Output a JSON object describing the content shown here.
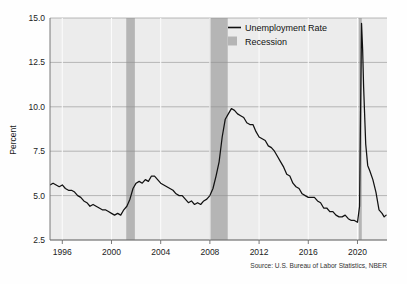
{
  "chart_data": {
    "type": "line",
    "title": "",
    "xlabel": "",
    "ylabel": "Percent",
    "xlim": [
      1995.0,
      2022.4
    ],
    "ylim": [
      2.5,
      15.0
    ],
    "grid": true,
    "legend_position": "top-right",
    "xticks": [
      "1996",
      "2000",
      "2004",
      "2008",
      "2012",
      "2016",
      "2020"
    ],
    "xtick_values": [
      1996,
      2000,
      2004,
      2008,
      2012,
      2016,
      2020
    ],
    "yticks": [
      "2.5",
      "5.0",
      "7.5",
      "10.0",
      "12.5",
      "15.0"
    ],
    "ytick_values": [
      2.5,
      5.0,
      7.5,
      10.0,
      12.5,
      15.0
    ],
    "series": [
      {
        "name": "Unemployment Rate",
        "color": "#111111",
        "x": [
          1995.0,
          1995.25,
          1995.5,
          1995.75,
          1996.0,
          1996.25,
          1996.5,
          1996.75,
          1997.0,
          1997.25,
          1997.5,
          1997.75,
          1998.0,
          1998.25,
          1998.5,
          1998.75,
          1999.0,
          1999.25,
          1999.5,
          1999.75,
          2000.0,
          2000.25,
          2000.5,
          2000.75,
          2001.0,
          2001.25,
          2001.5,
          2001.75,
          2002.0,
          2002.25,
          2002.5,
          2002.75,
          2003.0,
          2003.25,
          2003.5,
          2003.75,
          2004.0,
          2004.25,
          2004.5,
          2004.75,
          2005.0,
          2005.25,
          2005.5,
          2005.75,
          2006.0,
          2006.25,
          2006.5,
          2006.75,
          2007.0,
          2007.25,
          2007.5,
          2007.75,
          2008.0,
          2008.25,
          2008.5,
          2008.75,
          2009.0,
          2009.25,
          2009.5,
          2009.75,
          2010.0,
          2010.25,
          2010.5,
          2010.75,
          2011.0,
          2011.25,
          2011.5,
          2011.75,
          2012.0,
          2012.25,
          2012.5,
          2012.75,
          2013.0,
          2013.25,
          2013.5,
          2013.75,
          2014.0,
          2014.25,
          2014.5,
          2014.75,
          2015.0,
          2015.25,
          2015.5,
          2015.75,
          2016.0,
          2016.25,
          2016.5,
          2016.75,
          2017.0,
          2017.25,
          2017.5,
          2017.75,
          2018.0,
          2018.25,
          2018.5,
          2018.75,
          2019.0,
          2019.25,
          2019.5,
          2019.75,
          2020.0,
          2020.17,
          2020.33,
          2020.42,
          2020.5,
          2020.67,
          2020.83,
          2021.0,
          2021.25,
          2021.5,
          2021.75,
          2022.0,
          2022.17,
          2022.33
        ],
        "values": [
          5.6,
          5.7,
          5.6,
          5.5,
          5.6,
          5.4,
          5.3,
          5.3,
          5.2,
          5.0,
          4.9,
          4.7,
          4.6,
          4.4,
          4.5,
          4.4,
          4.3,
          4.2,
          4.2,
          4.1,
          4.0,
          3.9,
          4.0,
          3.9,
          4.2,
          4.4,
          4.8,
          5.4,
          5.7,
          5.8,
          5.7,
          5.9,
          5.8,
          6.1,
          6.1,
          5.9,
          5.7,
          5.6,
          5.5,
          5.4,
          5.3,
          5.1,
          5.0,
          5.0,
          4.8,
          4.6,
          4.7,
          4.5,
          4.6,
          4.5,
          4.7,
          4.8,
          5.0,
          5.4,
          6.1,
          6.9,
          8.3,
          9.3,
          9.6,
          9.9,
          9.8,
          9.6,
          9.5,
          9.4,
          9.1,
          9.0,
          9.0,
          8.6,
          8.3,
          8.2,
          8.1,
          7.8,
          7.7,
          7.5,
          7.2,
          6.9,
          6.6,
          6.2,
          6.1,
          5.7,
          5.5,
          5.4,
          5.1,
          5.0,
          4.9,
          4.9,
          4.9,
          4.7,
          4.6,
          4.3,
          4.3,
          4.1,
          4.1,
          3.9,
          3.8,
          3.8,
          3.9,
          3.7,
          3.6,
          3.6,
          3.5,
          4.4,
          14.7,
          13.2,
          11.1,
          7.9,
          6.7,
          6.4,
          5.9,
          5.2,
          4.2,
          4.0,
          3.8,
          3.9
        ]
      }
    ],
    "recession_bands": [
      {
        "start": 2001.2,
        "end": 2001.9
      },
      {
        "start": 2007.95,
        "end": 2009.45
      },
      {
        "start": 2020.1,
        "end": 2020.35
      }
    ],
    "recession_color": "#b5b5b5",
    "plot_background": "#ececec",
    "annotations": [
      "Source: U.S. Bureau of Labor Statistics, NBER"
    ]
  },
  "legend": {
    "items": [
      {
        "label": "Unemployment Rate",
        "marker": "line",
        "color": "#111111"
      },
      {
        "label": "Recession",
        "marker": "swatch",
        "color": "#b5b5b5"
      }
    ]
  },
  "source": {
    "text": "Source: U.S. Bureau of Labor Statistics, NBER"
  },
  "axes": {
    "y_title": "Percent"
  }
}
